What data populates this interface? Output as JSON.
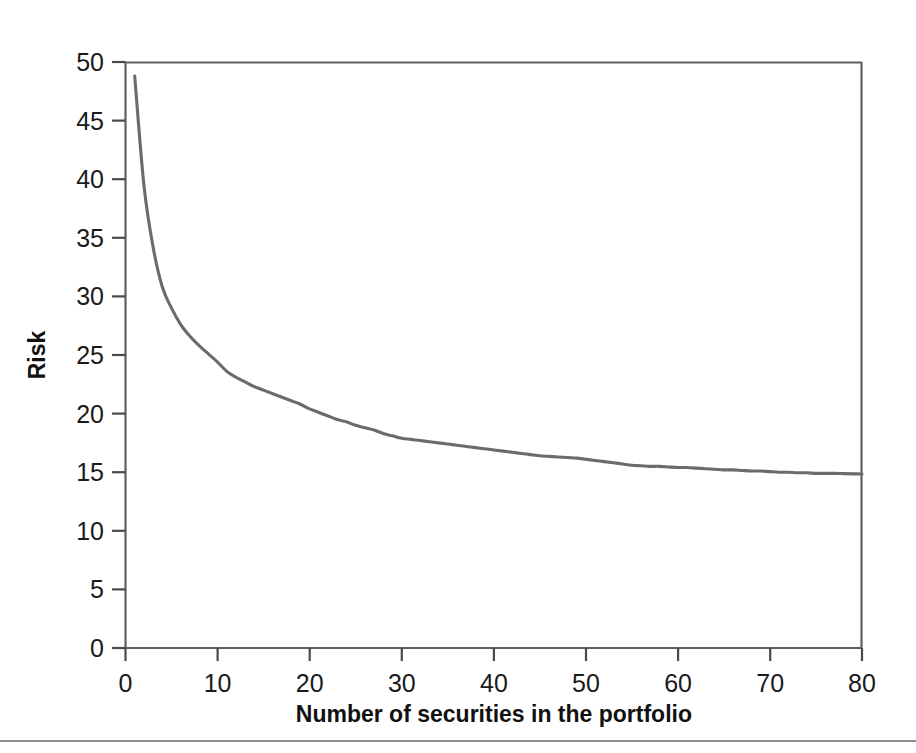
{
  "chart_data": {
    "type": "line",
    "title": "",
    "subtitle": "",
    "xlabel": "Number of securities in the portfolio",
    "ylabel": "Risk",
    "xlim": [
      0,
      80
    ],
    "ylim": [
      0,
      50
    ],
    "xticks": [
      0,
      10,
      20,
      30,
      40,
      50,
      60,
      70,
      80
    ],
    "yticks": [
      0,
      5,
      10,
      15,
      20,
      25,
      30,
      35,
      40,
      45,
      50
    ],
    "xtick_labels": [
      "0",
      "10",
      "20",
      "30",
      "40",
      "50",
      "60",
      "70",
      "80"
    ],
    "ytick_labels": [
      "0",
      "5",
      "10",
      "15",
      "20",
      "25",
      "30",
      "35",
      "40",
      "45",
      "50"
    ],
    "grid": false,
    "legend": null,
    "legend_position": "none",
    "series": [
      {
        "name": "Portfolio risk",
        "color": "#6b6b6b",
        "x": [
          1,
          2,
          3,
          4,
          5,
          6,
          7,
          8,
          9,
          10,
          11,
          12,
          13,
          14,
          15,
          16,
          17,
          18,
          19,
          20,
          21,
          22,
          23,
          24,
          25,
          26,
          27,
          28,
          29,
          30,
          31,
          32,
          33,
          34,
          35,
          36,
          37,
          38,
          39,
          40,
          41,
          42,
          43,
          44,
          45,
          46,
          47,
          48,
          49,
          50,
          51,
          52,
          53,
          54,
          55,
          56,
          57,
          58,
          59,
          60,
          61,
          62,
          63,
          64,
          65,
          66,
          67,
          68,
          69,
          70,
          71,
          72,
          73,
          74,
          75,
          76,
          77,
          78,
          79,
          80
        ],
        "y": [
          48.8,
          39.5,
          34.2,
          30.8,
          29.0,
          27.6,
          26.6,
          25.8,
          25.1,
          24.4,
          23.6,
          23.1,
          22.7,
          22.3,
          22.0,
          21.7,
          21.4,
          21.1,
          20.8,
          20.4,
          20.1,
          19.8,
          19.5,
          19.3,
          19.0,
          18.8,
          18.6,
          18.3,
          18.1,
          17.9,
          17.8,
          17.7,
          17.6,
          17.5,
          17.4,
          17.3,
          17.2,
          17.1,
          17.0,
          16.9,
          16.8,
          16.7,
          16.6,
          16.5,
          16.4,
          16.35,
          16.3,
          16.25,
          16.2,
          16.1,
          16.0,
          15.9,
          15.8,
          15.7,
          15.6,
          15.55,
          15.5,
          15.5,
          15.45,
          15.4,
          15.4,
          15.35,
          15.3,
          15.25,
          15.2,
          15.2,
          15.15,
          15.1,
          15.1,
          15.05,
          15.0,
          15.0,
          14.95,
          14.95,
          14.9,
          14.9,
          14.9,
          14.88,
          14.86,
          14.85
        ]
      }
    ],
    "annotations": []
  },
  "figure": {
    "background_color": "#ffffff",
    "axis_color": "#5f5f5f",
    "text_color": "#1a1a1a",
    "line_color": "#6b6b6b",
    "footer_rule": true
  }
}
